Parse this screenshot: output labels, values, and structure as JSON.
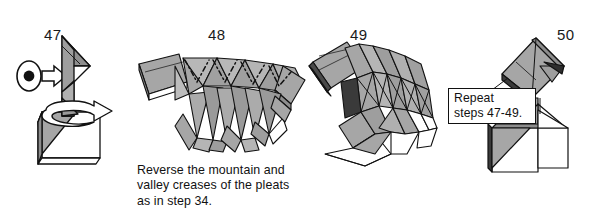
{
  "document": {
    "type": "origami-instruction-diagram",
    "background_color": "#ffffff",
    "ink_color": "#111111",
    "paper_front_color": "#a6a6a6",
    "paper_front_dark_color": "#8d8d8d",
    "paper_back_color": "#ffffff",
    "shadow_color": "#666666"
  },
  "steps": [
    {
      "id": "step-47",
      "number": "47",
      "symbols": [
        "eye-view-icon",
        "rotate-arrow-icon"
      ],
      "caption": ""
    },
    {
      "id": "step-48",
      "number": "48",
      "symbols": [
        "mountain-crease-dashes"
      ],
      "caption": "Reverse the mountain and\nvalley creases of the pleats\nas in step 34."
    },
    {
      "id": "step-49",
      "number": "49",
      "symbols": [],
      "caption": ""
    },
    {
      "id": "step-50",
      "number": "50",
      "symbols": [
        "leader-line"
      ],
      "callout": "Repeat\nsteps 47-49."
    }
  ]
}
